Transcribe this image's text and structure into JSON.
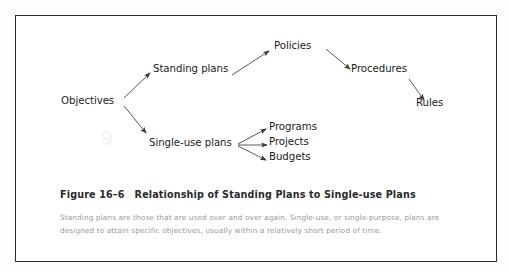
{
  "figure": {
    "number_label": "Figure 16–6",
    "title": "Relationship of Standing Plans to Single-use Plans",
    "body_text": "Standing plans are those that are used over and over again. Single-use, or single-purpose, plans are designed to attain specific objectives, usually within a relatively short period of time.",
    "watermark": "9",
    "border_color": "#2b2b2b",
    "text_color": "#1b1b1b",
    "caption_color": "#2a2a2a",
    "body_color": "#9a9a9a"
  },
  "diagram": {
    "type": "flow-tree",
    "nodes": [
      {
        "id": "objectives",
        "label": "Objectives"
      },
      {
        "id": "standing-plans",
        "label": "Standing plans"
      },
      {
        "id": "single-use-plans",
        "label": "Single-use plans"
      },
      {
        "id": "policies",
        "label": "Policies"
      },
      {
        "id": "procedures",
        "label": "Procedures"
      },
      {
        "id": "rules",
        "label": "Rules"
      },
      {
        "id": "programs",
        "label": "Programs"
      },
      {
        "id": "projects",
        "label": "Projects"
      },
      {
        "id": "budgets",
        "label": "Budgets"
      }
    ],
    "edges": [
      {
        "from": "objectives",
        "to": "standing-plans"
      },
      {
        "from": "objectives",
        "to": "single-use-plans"
      },
      {
        "from": "standing-plans",
        "to": "policies"
      },
      {
        "from": "policies",
        "to": "procedures"
      },
      {
        "from": "procedures",
        "to": "rules"
      },
      {
        "from": "single-use-plans",
        "to": "programs"
      },
      {
        "from": "single-use-plans",
        "to": "projects"
      },
      {
        "from": "single-use-plans",
        "to": "budgets"
      }
    ]
  }
}
